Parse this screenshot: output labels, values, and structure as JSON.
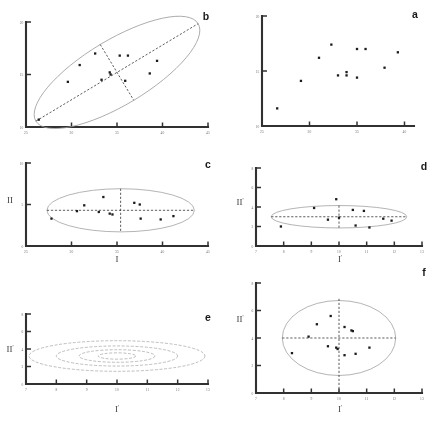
{
  "figure": {
    "title": "",
    "panel_count": 6,
    "background": "#ffffff",
    "ink_color": "#151515",
    "ellipse_color": "#9a9a9a"
  },
  "chart_data": [
    {
      "id": "a",
      "type": "scatter",
      "label": "a",
      "title": "",
      "xlabel": "",
      "ylabel": "",
      "xlim": [
        25,
        41
      ],
      "ylim": [
        10,
        20
      ],
      "xticks": [
        25,
        30,
        35,
        40
      ],
      "xticklabels": [
        "25",
        "30",
        "35",
        "40"
      ],
      "yticks": [
        10,
        15,
        20
      ],
      "yticklabels": [
        "10",
        "15",
        "20"
      ],
      "grid": false,
      "legend": "none",
      "points": [
        {
          "x": 26.6,
          "y": 11.6
        },
        {
          "x": 29.1,
          "y": 14.1
        },
        {
          "x": 31.0,
          "y": 16.2
        },
        {
          "x": 32.3,
          "y": 17.4
        },
        {
          "x": 33.0,
          "y": 14.6
        },
        {
          "x": 33.9,
          "y": 14.9
        },
        {
          "x": 33.9,
          "y": 14.6
        },
        {
          "x": 35.0,
          "y": 17.0
        },
        {
          "x": 35.0,
          "y": 14.4
        },
        {
          "x": 35.9,
          "y": 17.0
        },
        {
          "x": 37.9,
          "y": 15.3
        },
        {
          "x": 39.3,
          "y": 16.7
        }
      ]
    },
    {
      "id": "b",
      "type": "scatter",
      "label": "b",
      "title": "",
      "xlabel": "",
      "ylabel": "",
      "xlim": [
        25,
        45
      ],
      "ylim": [
        10,
        20
      ],
      "xticks": [
        25,
        30,
        35,
        40,
        45
      ],
      "xticklabels": [
        "25",
        "30",
        "35",
        "40",
        "45"
      ],
      "yticks": [
        10,
        15,
        20
      ],
      "yticklabels": [
        "10",
        "15",
        "20"
      ],
      "grid": false,
      "legend": "none",
      "annotation": "tilted confidence ellipse with dashed principal axes",
      "ellipse": {
        "cx": 35.0,
        "cy": 15.2,
        "rx": 10.4,
        "ry": 3.1,
        "rotation_deg": -31
      },
      "points": [
        {
          "x": 26.4,
          "y": 10.7
        },
        {
          "x": 29.6,
          "y": 14.3
        },
        {
          "x": 30.9,
          "y": 15.9
        },
        {
          "x": 32.6,
          "y": 17.0
        },
        {
          "x": 33.3,
          "y": 14.5
        },
        {
          "x": 34.2,
          "y": 15.2
        },
        {
          "x": 34.3,
          "y": 15.0
        },
        {
          "x": 35.3,
          "y": 16.8
        },
        {
          "x": 35.9,
          "y": 14.4
        },
        {
          "x": 36.2,
          "y": 16.8
        },
        {
          "x": 38.6,
          "y": 15.1
        },
        {
          "x": 39.4,
          "y": 16.3
        }
      ]
    },
    {
      "id": "c",
      "type": "scatter",
      "label": "c",
      "title": "",
      "xlabel": "I",
      "ylabel": "II",
      "xlim": [
        25,
        45
      ],
      "ylim": [
        0,
        10
      ],
      "xticks": [
        25,
        30,
        35,
        40,
        45
      ],
      "xticklabels": [
        "25",
        "30",
        "35",
        "40",
        "45"
      ],
      "yticks": [
        0,
        5,
        10
      ],
      "yticklabels": [
        "0",
        "5",
        "10"
      ],
      "grid": false,
      "legend": "none",
      "annotation": "axis-aligned ellipse with dashed major and minor axes",
      "ellipse": {
        "cx": 35.4,
        "cy": 4.3,
        "rx": 8.1,
        "ry": 2.6,
        "rotation_deg": 0
      },
      "points": [
        {
          "x": 27.8,
          "y": 3.3
        },
        {
          "x": 30.6,
          "y": 4.2
        },
        {
          "x": 31.4,
          "y": 4.9
        },
        {
          "x": 33.0,
          "y": 4.1
        },
        {
          "x": 33.5,
          "y": 5.9
        },
        {
          "x": 34.2,
          "y": 3.9
        },
        {
          "x": 34.5,
          "y": 3.8
        },
        {
          "x": 36.9,
          "y": 5.2
        },
        {
          "x": 37.5,
          "y": 5.0
        },
        {
          "x": 37.6,
          "y": 3.3
        },
        {
          "x": 39.8,
          "y": 3.2
        },
        {
          "x": 41.2,
          "y": 3.6
        }
      ]
    },
    {
      "id": "d",
      "type": "scatter",
      "label": "d",
      "title": "",
      "xlabel": "I'",
      "ylabel": "II'",
      "xlim": [
        7,
        13
      ],
      "ylim": [
        0,
        8
      ],
      "xticks": [
        7,
        8,
        9,
        10,
        11,
        12,
        13
      ],
      "xticklabels": [
        "7",
        "8",
        "9",
        "10",
        "11",
        "12",
        "13"
      ],
      "yticks": [
        0,
        2,
        4,
        6,
        8
      ],
      "yticklabels": [
        "0",
        "2",
        "4",
        "6",
        "8"
      ],
      "grid": false,
      "legend": "none",
      "annotation": "standardised ellipse with dashed axes",
      "ellipse": {
        "cx": 10.0,
        "cy": 3.0,
        "rx": 2.45,
        "ry": 1.15,
        "rotation_deg": 0
      },
      "points": [
        {
          "x": 7.9,
          "y": 2.0
        },
        {
          "x": 9.1,
          "y": 3.9
        },
        {
          "x": 9.6,
          "y": 2.7
        },
        {
          "x": 9.9,
          "y": 4.8
        },
        {
          "x": 10.0,
          "y": 2.9
        },
        {
          "x": 10.5,
          "y": 3.7
        },
        {
          "x": 10.6,
          "y": 2.1
        },
        {
          "x": 10.9,
          "y": 3.6
        },
        {
          "x": 11.1,
          "y": 1.9
        },
        {
          "x": 11.6,
          "y": 2.8
        },
        {
          "x": 11.9,
          "y": 2.6
        }
      ]
    },
    {
      "id": "e",
      "type": "contour",
      "label": "e",
      "title": "",
      "xlabel": "I'",
      "ylabel": "II'",
      "xlim": [
        7,
        13
      ],
      "ylim": [
        0,
        8
      ],
      "xticks": [
        7,
        8,
        9,
        10,
        11,
        12,
        13
      ],
      "xticklabels": [
        "7",
        "8",
        "9",
        "10",
        "11",
        "12",
        "13"
      ],
      "yticks": [
        0,
        2,
        4,
        6,
        8
      ],
      "yticklabels": [
        "0",
        "2",
        "4",
        "6",
        "8"
      ],
      "grid": false,
      "legend": "none",
      "annotation": "nested concentric probability contours",
      "contours": [
        {
          "cx": 10.0,
          "cy": 3.2,
          "rx": 2.9,
          "ry": 1.75,
          "level": 4
        },
        {
          "cx": 10.0,
          "cy": 3.2,
          "rx": 2.0,
          "ry": 1.15,
          "level": 3
        },
        {
          "cx": 10.0,
          "cy": 3.2,
          "rx": 1.25,
          "ry": 0.72,
          "level": 2
        },
        {
          "cx": 10.0,
          "cy": 3.2,
          "rx": 0.62,
          "ry": 0.36,
          "level": 1
        }
      ],
      "points": []
    },
    {
      "id": "f",
      "type": "scatter",
      "label": "f",
      "title": "",
      "xlabel": "I'",
      "ylabel": "II'",
      "xlim": [
        7,
        13
      ],
      "ylim": [
        0,
        8
      ],
      "xticks": [
        7,
        8,
        9,
        10,
        11,
        12,
        13
      ],
      "xticklabels": [
        "7",
        "8",
        "9",
        "10",
        "11",
        "12",
        "13"
      ],
      "yticks": [
        0,
        2,
        4,
        6,
        8
      ],
      "yticklabels": [
        "0",
        "2",
        "4",
        "6",
        "8"
      ],
      "grid": false,
      "legend": "none",
      "annotation": "circularised scatter inside unit circle with dashed axes",
      "circle": {
        "cx": 10.0,
        "cy": 4.0,
        "r": 2.05
      },
      "points": [
        {
          "x": 9.7,
          "y": 5.6
        },
        {
          "x": 9.2,
          "y": 5.0
        },
        {
          "x": 10.2,
          "y": 4.8
        },
        {
          "x": 10.45,
          "y": 4.55
        },
        {
          "x": 10.5,
          "y": 4.5
        },
        {
          "x": 8.9,
          "y": 4.1
        },
        {
          "x": 9.6,
          "y": 3.4
        },
        {
          "x": 9.9,
          "y": 3.3
        },
        {
          "x": 9.95,
          "y": 3.2
        },
        {
          "x": 11.1,
          "y": 3.3
        },
        {
          "x": 8.3,
          "y": 2.9
        },
        {
          "x": 10.2,
          "y": 2.75
        },
        {
          "x": 10.6,
          "y": 2.85
        }
      ]
    }
  ]
}
